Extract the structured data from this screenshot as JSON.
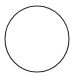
{
  "canvas": {
    "width": 75,
    "height": 81,
    "background_color": "#ffffff",
    "label": "Circle outline drawing"
  },
  "shape": {
    "name": "circle",
    "icon_name": "circle-outline-icon",
    "label": "Circle",
    "stroke_color": "#2b2b2b",
    "stroke_width": 1.05,
    "fill": "none",
    "center_x": 37,
    "center_y": 39,
    "radius_x": 32,
    "radius_y": 33
  }
}
